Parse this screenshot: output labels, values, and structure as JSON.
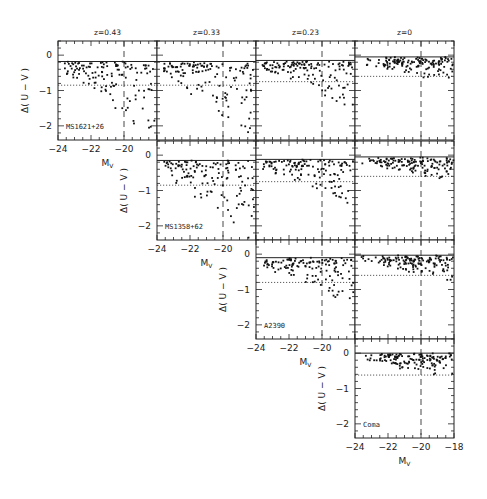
{
  "chart_data": {
    "type": "scatter",
    "layout": "triangular grid of panels, 4 columns (redshift) x 4 rows (cluster)",
    "columns": [
      {
        "title": "z=0.43"
      },
      {
        "title": "z=0.33"
      },
      {
        "title": "z=0.23"
      },
      {
        "title": "z=0"
      }
    ],
    "rows": [
      {
        "cluster": "MS1621+26",
        "start_col": 0
      },
      {
        "cluster": "MS1358+62",
        "start_col": 1
      },
      {
        "cluster": "A2390",
        "start_col": 2
      },
      {
        "cluster": "Coma",
        "start_col": 3
      }
    ],
    "xlabel": "M_V",
    "ylabel": "Δ( U − V )",
    "xlim": [
      -24,
      -18
    ],
    "ylim": [
      -2.4,
      0.4
    ],
    "xticks": [
      -24,
      -22,
      -20,
      -18
    ],
    "yticks": [
      0,
      -1,
      -2
    ],
    "reference_lines": {
      "solid_horizontal_at": 0,
      "dotted_horizontal_approx": [
        -0.85,
        -0.85,
        -0.8,
        -0.65
      ],
      "dashed_vertical_at": -20
    },
    "panels": [
      {
        "row": 0,
        "col": 0,
        "label": "MS1621+26",
        "dotted": -0.85,
        "solid": -0.18,
        "points_desc": "dense near 0 from -23 to -19; scatter to -2.3 at faint end (-20 to -18.5)"
      },
      {
        "row": 0,
        "col": 1,
        "dotted": -0.85,
        "solid": -0.18
      },
      {
        "row": 0,
        "col": 2,
        "dotted": -0.75,
        "solid": -0.15
      },
      {
        "row": 0,
        "col": 3,
        "dotted": -0.6,
        "solid": -0.05
      },
      {
        "row": 1,
        "col": 1,
        "label": "MS1358+62",
        "dotted": -0.85,
        "solid": -0.15
      },
      {
        "row": 1,
        "col": 2,
        "dotted": -0.75,
        "solid": -0.12
      },
      {
        "row": 1,
        "col": 3,
        "dotted": -0.6,
        "solid": -0.05
      },
      {
        "row": 2,
        "col": 2,
        "label": "A2390",
        "dotted": -0.8,
        "solid": -0.1
      },
      {
        "row": 2,
        "col": 3,
        "dotted": -0.6,
        "solid": -0.03
      },
      {
        "row": 3,
        "col": 3,
        "label": "Coma",
        "dotted": -0.62,
        "solid": 0
      }
    ],
    "title": ""
  }
}
